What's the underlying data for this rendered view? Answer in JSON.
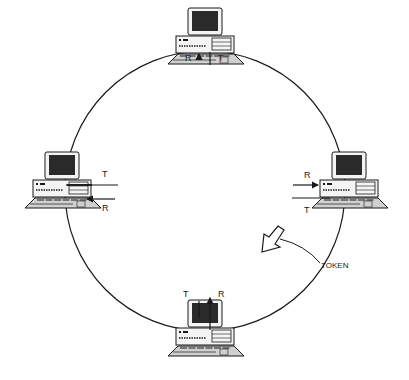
{
  "diagram": {
    "type": "token-ring-network",
    "colors": {
      "line": "#1a1a1a",
      "screen": "#2a2a2a",
      "case": "#f4f4f4",
      "keyboard": "#d0d0d0"
    },
    "nodes": [
      {
        "id": "top",
        "receive_label": "R",
        "transmit_label": "T"
      },
      {
        "id": "left",
        "receive_label": "R",
        "transmit_label": "T"
      },
      {
        "id": "right",
        "receive_label": "R",
        "transmit_label": "T"
      },
      {
        "id": "bottom",
        "receive_label": "R",
        "transmit_label": "T"
      }
    ],
    "token_label": "TOKEN",
    "icons": {
      "computer": "computer-icon",
      "token": "token-arrow-icon"
    }
  }
}
